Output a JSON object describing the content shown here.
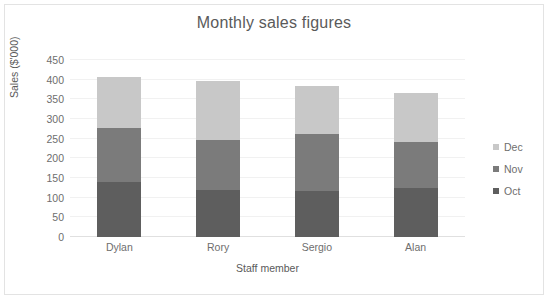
{
  "chart_data": {
    "type": "bar",
    "subtype": "stacked-column",
    "title": "Monthly sales figures",
    "xlabel": "Staff member",
    "ylabel": "Sales ($'000)",
    "categories": [
      "Dylan",
      "Rory",
      "Sergio",
      "Alan"
    ],
    "series": [
      {
        "name": "Oct",
        "color": "#5e5e5e",
        "values": [
          140,
          120,
          118,
          125
        ]
      },
      {
        "name": "Nov",
        "color": "#7b7b7b",
        "values": [
          137,
          126,
          145,
          117
        ]
      },
      {
        "name": "Dec",
        "color": "#c8c8c8",
        "values": [
          131,
          150,
          120,
          124
        ]
      }
    ],
    "totals": [
      408,
      396,
      383,
      366
    ],
    "ylim": [
      0,
      450
    ],
    "ytick_step": 50,
    "yticks": [
      0,
      50,
      100,
      150,
      200,
      250,
      300,
      350,
      400,
      450
    ],
    "grid": true,
    "grid_axis": "y",
    "legend": {
      "position": "right",
      "entries": [
        "Dec",
        "Nov",
        "Oct"
      ]
    },
    "stack_order_bottom_to_top": [
      "Oct",
      "Nov",
      "Dec"
    ]
  },
  "colors": {
    "background": "#ffffff",
    "border": "#e3e3e3",
    "gridline": "#f1f1f1",
    "baseline": "#e0e0e0",
    "title_text": "#5a5a5a",
    "tick_text": "#6e6e6e"
  }
}
